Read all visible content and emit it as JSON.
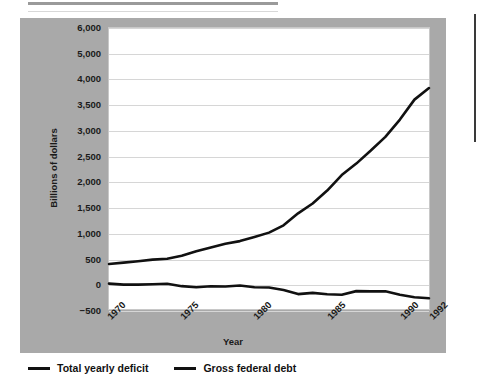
{
  "chart_data": {
    "type": "line",
    "title": "",
    "xlabel": "Year",
    "ylabel": "Billions of dollars",
    "grid": true,
    "legend_position": "bottom-left",
    "y_ticks": [
      6000,
      5000,
      4000,
      3500,
      3000,
      2500,
      2000,
      1500,
      1000,
      500,
      0,
      -500
    ],
    "y_tick_labels": [
      "6,000",
      "5,000",
      "4,000",
      "3,500",
      "3,000",
      "2,500",
      "2,000",
      "1,500",
      "1,000",
      "500",
      "0",
      "-500"
    ],
    "y_axis_scale": "ordinal-evenly-spaced",
    "x_ticks": [
      1970,
      1975,
      1980,
      1985,
      1990,
      1992
    ],
    "x_tick_labels": [
      "1970",
      "1975",
      "1980",
      "1985",
      "1990",
      "1992"
    ],
    "xlim": [
      1970,
      1992
    ],
    "x": [
      1970,
      1971,
      1972,
      1973,
      1974,
      1975,
      1976,
      1977,
      1978,
      1979,
      1980,
      1981,
      1982,
      1983,
      1984,
      1985,
      1986,
      1987,
      1988,
      1989,
      1990,
      1991,
      1992
    ],
    "series": [
      {
        "name": "Total yearly deficit",
        "color": "#111111",
        "values": [
          -3,
          -23,
          -23,
          -15,
          -6,
          -53,
          -74,
          -54,
          -59,
          -41,
          -74,
          -79,
          -128,
          -208,
          -185,
          -212,
          -221,
          -150,
          -155,
          -152,
          -221,
          -269,
          -290
        ]
      },
      {
        "name": "Gross federal debt",
        "color": "#111111",
        "values": [
          381,
          408,
          436,
          466,
          484,
          541,
          629,
          706,
          777,
          829,
          909,
          995,
          1137,
          1372,
          1565,
          1818,
          2121,
          2346,
          2601,
          2868,
          3207,
          3598,
          3825
        ]
      }
    ]
  },
  "legend": {
    "items": [
      {
        "label": "Total yearly deficit",
        "color": "#111111"
      },
      {
        "label": "Gross federal debt",
        "color": "#111111"
      }
    ]
  }
}
